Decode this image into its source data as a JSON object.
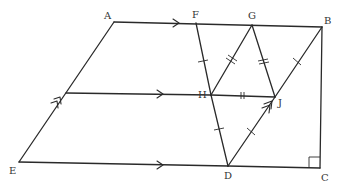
{
  "diagram": {
    "type": "geometry-figure",
    "points": [
      {
        "name": "A",
        "label": "A"
      },
      {
        "name": "B",
        "label": "B"
      },
      {
        "name": "C",
        "label": "C"
      },
      {
        "name": "D",
        "label": "D"
      },
      {
        "name": "E",
        "label": "E"
      },
      {
        "name": "F",
        "label": "F"
      },
      {
        "name": "G",
        "label": "G"
      },
      {
        "name": "H",
        "label": "H"
      },
      {
        "name": "J",
        "label": "J"
      }
    ],
    "segments": [
      "AB",
      "BC",
      "CD",
      "DE",
      "EA",
      "FH",
      "HD",
      "FG",
      "GH",
      "GJ",
      "JB",
      "HJ",
      "DJ"
    ],
    "markings": {
      "single_tick": [
        "FH",
        "HD",
        "DJ",
        "JB"
      ],
      "double_tick": [
        "GH",
        "GJ",
        "HJ"
      ],
      "single_arrow": [
        "AF",
        "ED",
        "midline"
      ],
      "double_arrow": [
        "EA",
        "DJ"
      ],
      "right_angle": "C"
    }
  },
  "labels": {
    "A": "A",
    "B": "B",
    "C": "C",
    "D": "D",
    "E": "E",
    "F": "F",
    "G": "G",
    "H": "H",
    "J": "J"
  }
}
